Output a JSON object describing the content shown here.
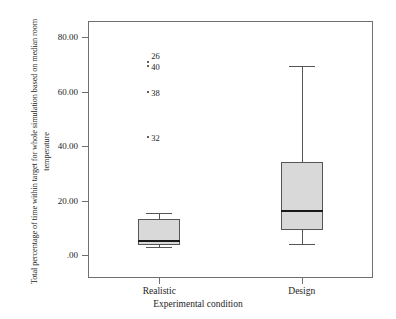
{
  "chart_data": {
    "type": "box",
    "title": "",
    "xlabel": "Experimental condition",
    "ylabel": "Total percentage of time within target for whole simulation based on median room temperature",
    "ylim": [
      -5,
      84
    ],
    "yticks": [
      0,
      20,
      40,
      60,
      80
    ],
    "ytick_labels": [
      ".00",
      "20.00",
      "40.00",
      "60.00",
      "80.00"
    ],
    "categories": [
      "Realistic",
      "Design"
    ],
    "grid": false,
    "legend": "none",
    "boxes": [
      {
        "category": "Realistic",
        "whisker_low": 3.0,
        "q1": 3.6,
        "median": 5.2,
        "q3": 13.2,
        "whisker_high": 15.5,
        "outliers": [
          {
            "value": 71.0,
            "label": "26"
          },
          {
            "value": 69.3,
            "label": "40"
          },
          {
            "value": 59.8,
            "label": "38"
          },
          {
            "value": 43.4,
            "label": "32"
          }
        ]
      },
      {
        "category": "Design",
        "whisker_low": 4.0,
        "q1": 9.2,
        "median": 16.0,
        "q3": 34.1,
        "whisker_high": 69.4,
        "outliers": []
      }
    ],
    "colors": {
      "box_fill": "#d9d9d9",
      "box_edge": "#555555",
      "median_line": "#1a1a1a",
      "frame": "#6f6f6f",
      "text": "#1d1d1d",
      "background": "#ffffff"
    }
  }
}
